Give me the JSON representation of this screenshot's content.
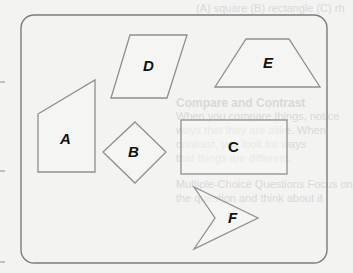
{
  "figure": {
    "shapes": [
      {
        "id": "A",
        "label": "A",
        "kind": "quadrilateral (right trapezoid)"
      },
      {
        "id": "B",
        "label": "B",
        "kind": "square (rotated)"
      },
      {
        "id": "C",
        "label": "C",
        "kind": "rectangle"
      },
      {
        "id": "D",
        "label": "D",
        "kind": "parallelogram"
      },
      {
        "id": "E",
        "label": "E",
        "kind": "trapezoid"
      },
      {
        "id": "F",
        "label": "F",
        "kind": "concave quadrilateral (arrowhead)"
      }
    ]
  },
  "bleed_through": {
    "line1": "(A) square   (B) rectangle   (C) rh",
    "line2": "Compare and Contrast",
    "line3": "When you compare things, notice",
    "line4": "ways that they are alike. When",
    "line5": "contrast, you look for ways",
    "line6": "that things are different.",
    "line7": "Multiple-Choice Questions Focus on",
    "line8": "the question and think about it"
  }
}
